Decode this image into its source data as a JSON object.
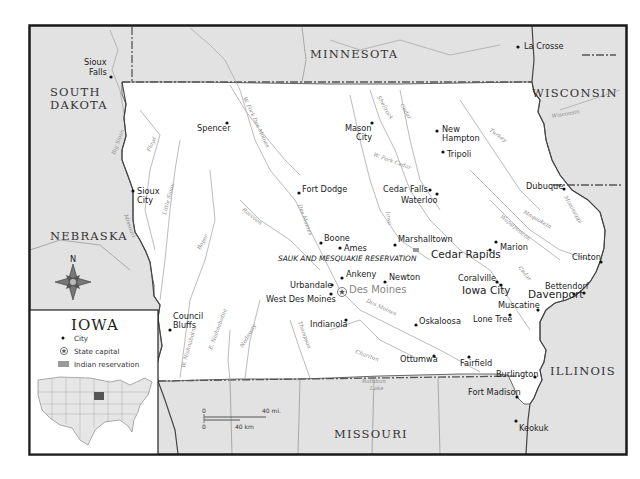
{
  "map": {
    "title": "IOWA",
    "colors": {
      "iowa_fill": "#ffffff",
      "neighbor_fill": "#e2e2e2",
      "river": "#a8a8a8",
      "border": "#555555",
      "frame": "#1a1a1a",
      "inset_iowa": "#555555"
    },
    "states": {
      "minnesota": "MINNESOTA",
      "south_dakota_1": "SOUTH",
      "south_dakota_2": "DAKOTA",
      "wisconsin": "WISCONSIN",
      "nebraska": "NEBRASKA",
      "illinois": "ILLINOIS",
      "missouri": "MISSOURI"
    },
    "cities": {
      "sioux_falls_1": "Sioux",
      "sioux_falls_2": "Falls",
      "la_crosse": "La Crosse",
      "spencer": "Spencer",
      "mason_city_1": "Mason",
      "mason_city_2": "City",
      "new_hampton_1": "New",
      "new_hampton_2": "Hampton",
      "tripoli": "Tripoli",
      "sioux_city_1": "Sioux",
      "sioux_city_2": "City",
      "fort_dodge": "Fort Dodge",
      "cedar_falls": "Cedar Falls",
      "waterloo": "Waterloo",
      "dubuque": "Dubuque",
      "boone": "Boone",
      "ames": "Ames",
      "marshalltown": "Marshalltown",
      "cedar_rapids": "Cedar Rapids",
      "marion": "Marion",
      "clinton": "Clinton",
      "ankeny": "Ankeny",
      "newton": "Newton",
      "coralville": "Coralville",
      "iowa_city": "Iowa City",
      "urbandale": "Urbandale",
      "des_moines": "Des Moines",
      "west_des_moines": "West Des Moines",
      "bettendorf": "Bettendorf",
      "davenport": "Davenport",
      "muscatine": "Muscatine",
      "council_bluffs_1": "Council",
      "council_bluffs_2": "Bluffs",
      "indianola": "Indianola",
      "oskaloosa": "Oskaloosa",
      "lone_tree": "Lone Tree",
      "ottumwa": "Ottumwa",
      "fairfield": "Fairfield",
      "burlington": "Burlington",
      "fort_madison": "Fort Madison",
      "keokuk": "Keokuk"
    },
    "reservation": "SAUK AND MESQUAKIE RESERVATION",
    "rivers": {
      "big_sioux": "Big Sioux",
      "floyd": "Floyd",
      "little_sioux": "Little Sioux",
      "missouri": "Missouri",
      "w_fork_des_moines": "W. Fork Des Moines",
      "des_moines_1": "Des Moines",
      "des_moines_2": "Des Moines",
      "raccoon": "Raccoon",
      "boyer": "Boyer",
      "shellrock": "Shellrock",
      "cedar_1": "Cedar",
      "cedar_2": "Cedar",
      "w_fork_cedar": "W. Fork Cedar",
      "iowa": "Iowa",
      "turkey": "Turkey",
      "wisconsin": "Wisconsin",
      "maquoketa": "Maquoketa",
      "wapsipinicon": "Wapsipinicon",
      "mississippi": "Mississippi",
      "w_nishnabotna": "W. Nishnabotna",
      "e_nishnabotna": "E. Nishnabotna",
      "nodaway": "Nodaway",
      "thompson": "Thompson",
      "chariton": "Chariton",
      "rathbun_1": "Rathbun",
      "rathbun_2": "Lake"
    },
    "compass": {
      "label": "N"
    },
    "legend": {
      "title": "IOWA",
      "items": [
        {
          "icon": "city-dot-icon",
          "label": "City"
        },
        {
          "icon": "state-capital-icon",
          "label": "State capital"
        },
        {
          "icon": "indian-reservation-icon",
          "label": "Indian reservation"
        }
      ]
    },
    "scale": {
      "top_zero": "0",
      "top_end": "40 mi.",
      "bottom_zero": "0",
      "bottom_end": "40 km"
    }
  }
}
